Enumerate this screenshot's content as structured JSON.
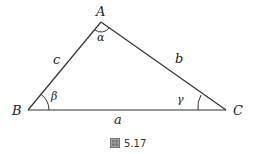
{
  "diagram": {
    "type": "triangle",
    "vertices": [
      {
        "name": "A",
        "label": "A",
        "x": 101,
        "y": 22
      },
      {
        "name": "B",
        "label": "B",
        "x": 28,
        "y": 110
      },
      {
        "name": "C",
        "label": "C",
        "x": 226,
        "y": 110
      }
    ],
    "sides": [
      {
        "name": "a",
        "label": "a",
        "between": [
          "B",
          "C"
        ]
      },
      {
        "name": "b",
        "label": "b",
        "between": [
          "A",
          "C"
        ]
      },
      {
        "name": "c",
        "label": "c",
        "between": [
          "A",
          "B"
        ]
      }
    ],
    "angles": [
      {
        "vertex": "A",
        "label": "α"
      },
      {
        "vertex": "B",
        "label": "β"
      },
      {
        "vertex": "C",
        "label": "γ"
      }
    ],
    "caption": {
      "icon": "figure-icon",
      "label": "5.17"
    },
    "colors": {
      "line": "#333333",
      "text": "#222222"
    }
  }
}
